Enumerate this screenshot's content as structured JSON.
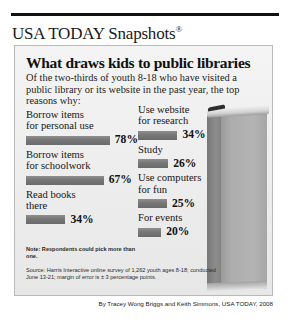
{
  "brand": {
    "logo_text": "USA TODAY Snapshots",
    "registration_mark": "®"
  },
  "headline": "What draws kids to public libraries",
  "deck": "Of the two-thirds of youth 8-18 who have visited a public library or its website in the past year, the top reasons why:",
  "chart_data": {
    "type": "bar",
    "title": "What draws kids to public libraries",
    "subtitle": "Of the two-thirds of youth 8-18 who have visited a public library or its website in the past year, the top reasons why:",
    "xlabel": "",
    "ylabel": "",
    "xlim": [
      0,
      100
    ],
    "unit": "%",
    "grid": false,
    "legend": "none",
    "orientation": "horizontal",
    "categories": [
      "Borrow items for personal use",
      "Borrow items for schoolwork",
      "Read books there",
      "Use website for research",
      "Study",
      "Use computers for fun",
      "For events"
    ],
    "values": [
      78,
      67,
      34,
      34,
      26,
      25,
      20
    ],
    "bar_color": "#777777"
  },
  "columns": {
    "left": [
      {
        "label_line1": "Borrow items",
        "label_line2": "for personal use",
        "value": 78,
        "value_text": "78%"
      },
      {
        "label_line1": "Borrow items",
        "label_line2": "for schoolwork",
        "value": 67,
        "value_text": "67%"
      },
      {
        "label_line1": "Read books",
        "label_line2": "there",
        "value": 34,
        "value_text": "34%"
      }
    ],
    "right": [
      {
        "label_line1": "Use website",
        "label_line2": "for research",
        "value": 34,
        "value_text": "34%"
      },
      {
        "label_line1": "Study",
        "label_line2": "",
        "value": 26,
        "value_text": "26%"
      },
      {
        "label_line1": "Use computers",
        "label_line2": "for fun",
        "value": 25,
        "value_text": "25%"
      },
      {
        "label_line1": "For events",
        "label_line2": "",
        "value": 20,
        "value_text": "20%"
      }
    ]
  },
  "note": "Note: Respondents could pick more than one.",
  "source": "Source: Harris Interactive online survey of 1,262 youth ages 8-18; conducted June 13-21; margin of error is ± 3 percentage points.",
  "credit": "By Tracey Wong Briggs and Keith Simmons, USA TODAY, 2008"
}
